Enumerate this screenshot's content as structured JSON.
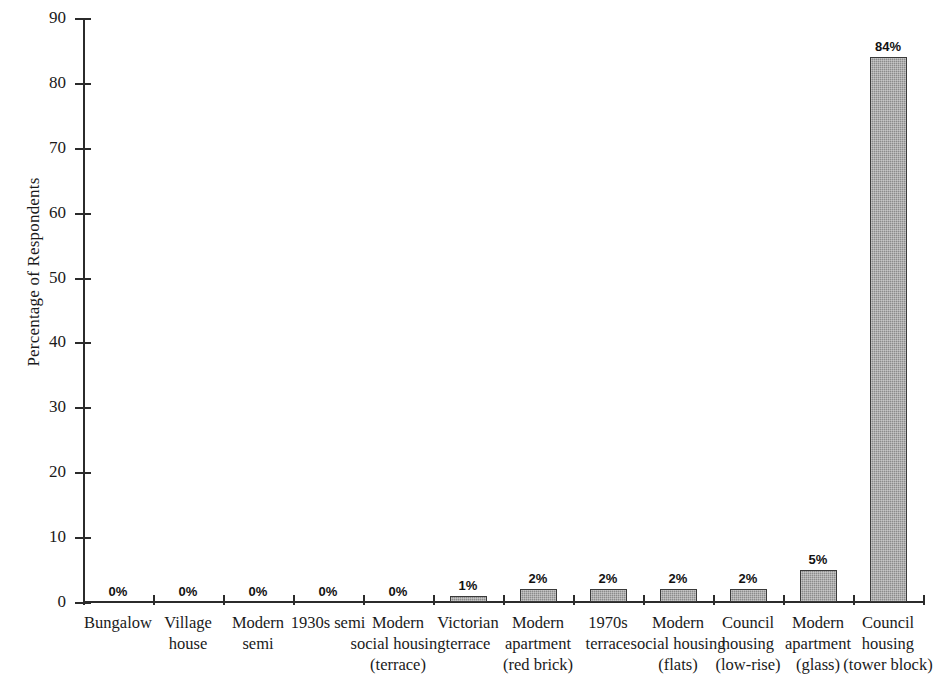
{
  "chart_data": {
    "type": "bar",
    "title": "",
    "xlabel": "",
    "ylabel": "Percentage of Respondents",
    "ylim": [
      0,
      90
    ],
    "ytick_step": 10,
    "yticks": [
      0,
      10,
      20,
      30,
      40,
      50,
      60,
      70,
      80,
      90
    ],
    "grid": false,
    "legend": null,
    "value_label_suffix": "%",
    "categories": [
      "Bungalow",
      "Village house",
      "Modern semi",
      "1930s semi",
      "Modern social housing (terrace)",
      "Victorian terrace",
      "Modern apartment (red brick)",
      "1970s terrace",
      "Modern social housing (flats)",
      "Council housing (low-rise)",
      "Modern apartment (glass)",
      "Council housing (tower block)"
    ],
    "category_label_lines": [
      [
        "Bungalow"
      ],
      [
        "Village",
        "house"
      ],
      [
        "Modern",
        "semi"
      ],
      [
        "1930s semi"
      ],
      [
        "Modern",
        "social housing",
        "(terrace)"
      ],
      [
        "Victorian",
        "terrace"
      ],
      [
        "Modern",
        "apartment",
        "(red brick)"
      ],
      [
        "1970s",
        "terrace"
      ],
      [
        "Modern",
        "social housing",
        "(flats)"
      ],
      [
        "Council",
        "housing",
        "(low-rise)"
      ],
      [
        "Modern",
        "apartment",
        "(glass)"
      ],
      [
        "Council",
        "housing",
        "(tower block)"
      ]
    ],
    "values": [
      0,
      0,
      0,
      0,
      0,
      1,
      2,
      2,
      2,
      2,
      5,
      84
    ],
    "value_labels": [
      "0%",
      "0%",
      "0%",
      "0%",
      "0%",
      "1%",
      "2%",
      "2%",
      "2%",
      "2%",
      "5%",
      "84%"
    ],
    "bar_color": "#8b8b8b",
    "bar_edge_color": "#3a3a3a",
    "background_color": "#ffffff",
    "axis_color": "#2b2b2b"
  }
}
